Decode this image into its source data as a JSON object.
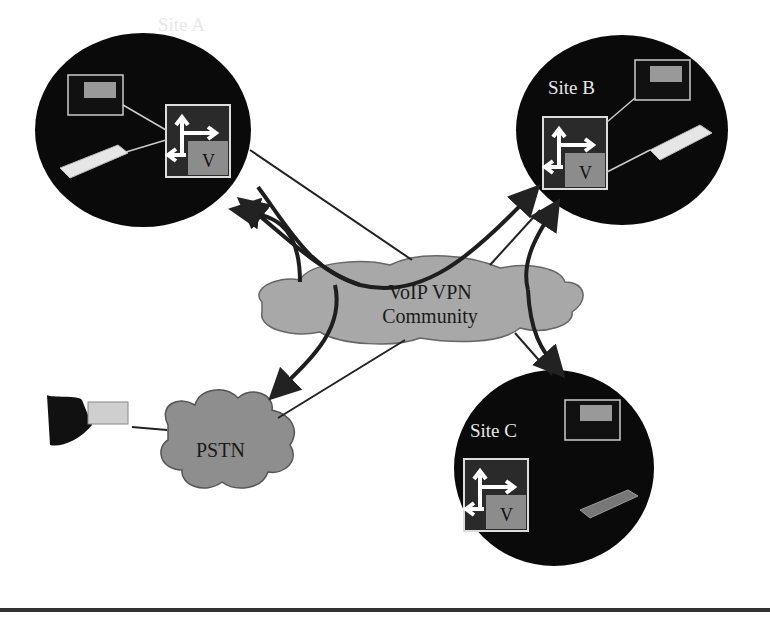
{
  "diagram": {
    "colors": {
      "site_fill": "#0a0a0a",
      "cloud_fill": "#a8a8a8",
      "cloud_stroke": "#555555",
      "arrow": "#222222",
      "router_gray": "#8c8c8c",
      "router_dark": "#2a2a2a"
    },
    "nodes": [
      {
        "id": "site-a",
        "label": "Site A",
        "type": "site",
        "contains": [
          "ip-phone",
          "analog-phone",
          "vpn-router"
        ]
      },
      {
        "id": "site-b",
        "label": "Site B",
        "type": "site",
        "contains": [
          "ip-phone",
          "analog-phone",
          "vpn-router"
        ]
      },
      {
        "id": "site-c",
        "label": "Site C",
        "type": "site",
        "contains": [
          "ip-phone",
          "analog-phone",
          "vpn-router"
        ]
      },
      {
        "id": "vpn-cloud",
        "label_line1": "VoIP VPN",
        "label_line2": "Community",
        "type": "cloud"
      },
      {
        "id": "pstn",
        "label": "PSTN",
        "type": "cloud"
      },
      {
        "id": "pstn-phone",
        "type": "phone"
      }
    ],
    "router_mark": "V",
    "edges": [
      {
        "from": "vpn-cloud",
        "to": "site-a",
        "style": "thin line"
      },
      {
        "from": "site-b",
        "to": "site-a",
        "style": "thick arrow via cloud"
      },
      {
        "from": "site-a",
        "to": "site-b",
        "style": "thick arrow via cloud"
      },
      {
        "from": "pstn",
        "to": "site-a",
        "style": "thick arrow"
      },
      {
        "from": "site-c",
        "to": "site-b",
        "style": "thick arrow"
      },
      {
        "from": "site-b",
        "to": "site-c",
        "style": "thick arrow"
      },
      {
        "from": "vpn-cloud",
        "to": "site-b",
        "style": "thin line"
      },
      {
        "from": "vpn-cloud",
        "to": "site-c",
        "style": "thin line"
      },
      {
        "from": "vpn-cloud",
        "to": "pstn",
        "style": "thin line"
      },
      {
        "from": "site-a",
        "to": "pstn",
        "style": "thick arrow"
      },
      {
        "from": "pstn",
        "to": "pstn-phone",
        "style": "thin line"
      }
    ]
  }
}
